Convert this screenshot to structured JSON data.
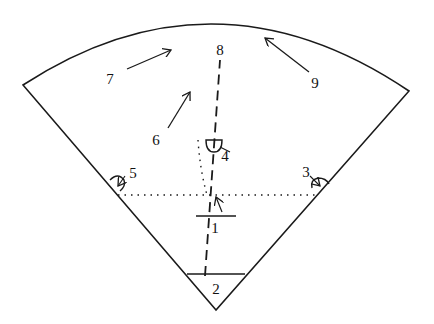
{
  "diagram": {
    "type": "sector-field-diagram",
    "stroke_color": "#1a1a1a",
    "background": "#ffffff",
    "labels": [
      {
        "id": "1",
        "text": "1",
        "x": 215,
        "y": 228
      },
      {
        "id": "2",
        "text": "2",
        "x": 216,
        "y": 289
      },
      {
        "id": "3",
        "text": "3",
        "x": 306,
        "y": 172
      },
      {
        "id": "4",
        "text": "4",
        "x": 225,
        "y": 156
      },
      {
        "id": "5",
        "text": "5",
        "x": 133,
        "y": 173
      },
      {
        "id": "6",
        "text": "6",
        "x": 156,
        "y": 140
      },
      {
        "id": "7",
        "text": "7",
        "x": 110,
        "y": 79
      },
      {
        "id": "8",
        "text": "8",
        "x": 220,
        "y": 50
      },
      {
        "id": "9",
        "text": "9",
        "x": 315,
        "y": 83
      }
    ],
    "arrows": [
      {
        "id": "arrow-7",
        "from": [
          127,
          69
        ],
        "to": [
          171,
          50
        ]
      },
      {
        "id": "arrow-6",
        "from": [
          168,
          128
        ],
        "to": [
          190,
          92
        ]
      },
      {
        "id": "arrow-9",
        "from": [
          309,
          72
        ],
        "to": [
          265,
          38
        ]
      },
      {
        "id": "arrow-1",
        "from": [
          222,
          212
        ],
        "to": [
          216,
          197
        ]
      }
    ]
  }
}
